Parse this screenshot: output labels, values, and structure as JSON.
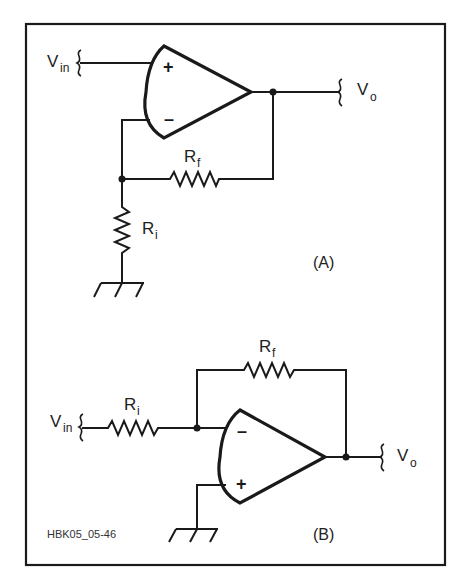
{
  "figure": {
    "id_label": "HBK05_05-46",
    "frame_color": "#1a1a1a",
    "background": "#ffffff"
  },
  "circuit_a": {
    "caption": "(A)",
    "type": "non-inverting amplifier",
    "input": {
      "label": "V",
      "sub": "in"
    },
    "output": {
      "label": "V",
      "sub": "o"
    },
    "opamp": {
      "plus": "+",
      "minus": "–"
    },
    "rf": {
      "label": "R",
      "sub": "f"
    },
    "ri": {
      "label": "R",
      "sub": "i"
    }
  },
  "circuit_b": {
    "caption": "(B)",
    "type": "inverting amplifier",
    "input": {
      "label": "V",
      "sub": "in"
    },
    "output": {
      "label": "V",
      "sub": "o"
    },
    "opamp": {
      "plus": "+",
      "minus": "–"
    },
    "rf": {
      "label": "R",
      "sub": "f"
    },
    "ri": {
      "label": "R",
      "sub": "i"
    }
  }
}
